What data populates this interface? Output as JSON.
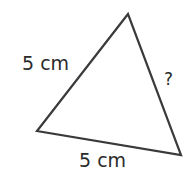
{
  "diagram": {
    "type": "triangle",
    "vertices": {
      "top": [
        128,
        14
      ],
      "left": [
        37,
        131
      ],
      "right": [
        181,
        155
      ]
    },
    "stroke_color": "#3a3a3a",
    "labels": {
      "left_side": "5 cm",
      "bottom_side": "5 cm",
      "right_side": "?"
    }
  }
}
